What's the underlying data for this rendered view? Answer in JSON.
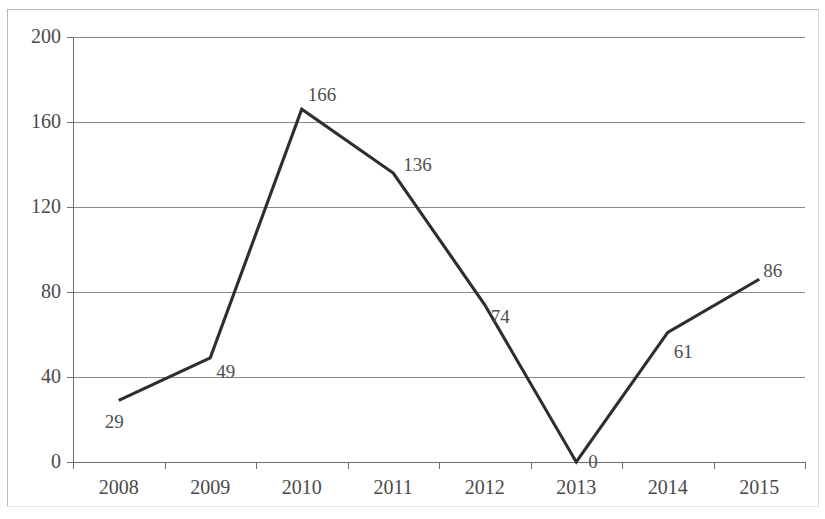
{
  "chart_data": {
    "type": "line",
    "title": "",
    "subtitle": "",
    "xlabel": "",
    "ylabel": "",
    "categories": [
      "2008",
      "2009",
      "2010",
      "2011",
      "2012",
      "2013",
      "2014",
      "2015"
    ],
    "values": [
      29,
      49,
      166,
      136,
      74,
      0,
      61,
      86
    ],
    "point_labels": [
      "29",
      "49",
      "166",
      "136",
      "74",
      "0",
      "61",
      "86"
    ],
    "ylim": [
      0,
      200
    ],
    "y_ticks": [
      0,
      40,
      80,
      120,
      160,
      200
    ],
    "y_tick_labels": [
      "0",
      "40",
      "80",
      "120",
      "160",
      "200"
    ],
    "grid": "horizontal",
    "legend": "none",
    "series": [
      {
        "name": "",
        "values": [
          29,
          49,
          166,
          136,
          74,
          0,
          61,
          86
        ]
      }
    ],
    "colors": {
      "line": "#2e2e2e",
      "gridline": "#8a8a8a",
      "axis": "#6d6d6d",
      "label_text": "#4a4a4a",
      "background": "#ffffff",
      "frame": "#b9b9b9"
    },
    "label_offsets": [
      {
        "dx": -14,
        "dy": 12
      },
      {
        "dx": 6,
        "dy": 4
      },
      {
        "dx": 6,
        "dy": -24
      },
      {
        "dx": 10,
        "dy": -18
      },
      {
        "dx": 6,
        "dy": 2
      },
      {
        "dx": 12,
        "dy": -10
      },
      {
        "dx": 6,
        "dy": 10
      },
      {
        "dx": 4,
        "dy": -18
      }
    ]
  }
}
